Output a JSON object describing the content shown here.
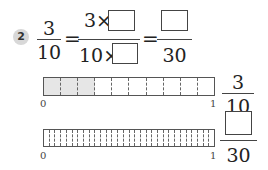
{
  "problem": {
    "number": "2",
    "fraction1": {
      "numerator": "3",
      "denominator": "10"
    },
    "equals": "=",
    "fraction2": {
      "numerator_prefix": "3×",
      "denominator_prefix": "10×",
      "numerator_blank": "",
      "denominator_blank": ""
    },
    "fraction3": {
      "numerator_blank": "",
      "denominator": "30"
    }
  },
  "bars": [
    {
      "segments": 10,
      "shaded": 3,
      "start_label": "0",
      "end_label": "1",
      "fraction": {
        "numerator": "3",
        "denominator": "10"
      }
    },
    {
      "segments": 30,
      "shaded": 0,
      "start_label": "0",
      "end_label": "1",
      "fraction": {
        "numerator_blank": "",
        "denominator": "30"
      }
    }
  ],
  "colors": {
    "badge": "#d8d8d8",
    "shade": "#e6e6e6",
    "line": "#444444"
  }
}
